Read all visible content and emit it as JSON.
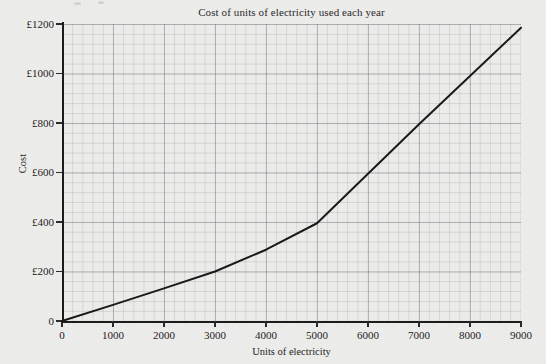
{
  "chart_data": {
    "type": "line",
    "title": "Cost of units of electricity used each year",
    "xlabel": "Units of electricity",
    "ylabel": "Cost",
    "xlim": [
      0,
      9000
    ],
    "ylim": [
      0,
      1200
    ],
    "grid": true,
    "minor_grid": true,
    "legend": "none",
    "currency_symbol": "£",
    "x_tick_labels": [
      "0",
      "1000",
      "2000",
      "3000",
      "4000",
      "5000",
      "6000",
      "7000",
      "8000",
      "9000"
    ],
    "x_tick_values": [
      0,
      1000,
      2000,
      3000,
      4000,
      5000,
      6000,
      7000,
      8000,
      9000
    ],
    "y_tick_labels": [
      "0",
      "£200",
      "£400",
      "£600",
      "£800",
      "£1000",
      "£1200"
    ],
    "y_tick_values": [
      0,
      200,
      400,
      600,
      800,
      1000,
      1200
    ],
    "x_minor_step": 200,
    "y_minor_step": 40,
    "series": [
      {
        "name": "Cost of electricity",
        "color": "#1a1a1a",
        "line_width": 2,
        "x": [
          0,
          1000,
          2000,
          3000,
          4000,
          5000,
          6000,
          7000,
          8000,
          9000
        ],
        "values": [
          0,
          65,
          132,
          200,
          288,
          395,
          595,
          795,
          990,
          1185
        ]
      }
    ],
    "annotations": []
  },
  "figure": {
    "background_color": "#ececeb",
    "plot_background_color": "#ebebe9",
    "grid_color": "#78787d",
    "axis_color": "#1c1c1c",
    "text_color": "#232323"
  }
}
